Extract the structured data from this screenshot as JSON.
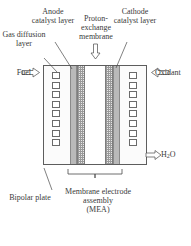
{
  "diagram": {
    "labels": {
      "gas_diffusion_layer": "Gas diffusion layer",
      "anode_catalyst_layer": "Anode catalyst layer",
      "proton_exchange_membrane": "Proton-exchange membrane",
      "cathode_catalyst_layer": "Cathode catalyst layer",
      "fuel": "Fuel",
      "oxidant": "Oxidant",
      "water": "H",
      "water_sub": "2",
      "water_tail": "O",
      "bipolar_plate": "Bipolar plate",
      "membrane_electrode_assembly": "Membrane electrode assembly",
      "mea_abbrev": "(MEA)"
    },
    "icons": {
      "fuel_inlet": "arrow-right-icon",
      "oxidant_inlet": "arrow-left-icon",
      "water_outlet": "arrow-right-icon",
      "membrane_pointer": "arrow-down-icon"
    },
    "colors": {
      "outline": "#5d5d5d",
      "catalyst_fill": "#b9b9b9",
      "membrane_fill": "#e9e9e9",
      "plate_fill": "#ffffff",
      "text": "#3a3a3a"
    },
    "structure": {
      "layers": [
        {
          "name": "bipolar-plate-left",
          "kind": "plate"
        },
        {
          "name": "gas-diffusion-layer-left",
          "kind": "gdl"
        },
        {
          "name": "anode-catalyst-layer",
          "kind": "catalyst"
        },
        {
          "name": "proton-exchange-membrane-left",
          "kind": "membrane"
        },
        {
          "name": "channel",
          "kind": "mid"
        },
        {
          "name": "proton-exchange-membrane-right",
          "kind": "membrane"
        },
        {
          "name": "cathode-catalyst-layer",
          "kind": "catalyst"
        },
        {
          "name": "gas-diffusion-layer-right",
          "kind": "gdl"
        },
        {
          "name": "bipolar-plate-right",
          "kind": "plate"
        }
      ],
      "channel_squares_per_column": 8,
      "columns": 2
    }
  }
}
